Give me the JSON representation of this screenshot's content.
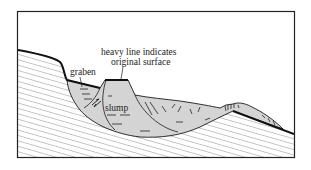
{
  "diagram": {
    "type": "geologic cross-section",
    "labels": {
      "graben": "graben",
      "slump": "slump",
      "note_line1": "heavy line indicates",
      "note_line2": "original surface"
    },
    "colors": {
      "frame": "#222222",
      "bedrock_hatch": "#555555",
      "slump_fill": "#d4d4d4",
      "outline": "#1a1a1a",
      "background": "#ffffff"
    }
  }
}
